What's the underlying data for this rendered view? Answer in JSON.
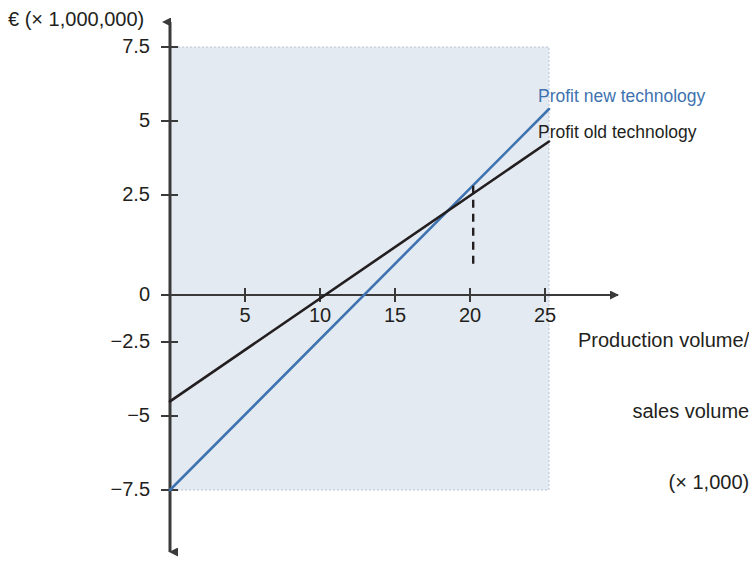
{
  "chart_data": {
    "type": "line",
    "title": "",
    "subtitle": "",
    "ylabel": "€ (× 1,000,000)",
    "xlabel_lines": [
      "Production volume/",
      "sales volume",
      "(× 1,000)"
    ],
    "xlabel": "Production volume/ sales volume (× 1,000)",
    "xlim": [
      0,
      25
    ],
    "ylim": [
      -7.5,
      7.5
    ],
    "xticks": [
      5,
      10,
      15,
      20,
      25
    ],
    "xtick_labels": [
      "5",
      "10",
      "15",
      "20",
      "25"
    ],
    "yticks": [
      7.5,
      5,
      2.5,
      0,
      -2.5,
      -5,
      -7.5
    ],
    "ytick_labels": [
      "7.5",
      "5",
      "2.5",
      "0",
      "−2.5",
      "−5",
      "−7.5"
    ],
    "grid": false,
    "legend_position": "right-inline",
    "series": [
      {
        "name": "Profit new technology",
        "color": "#3e73b0",
        "x": [
          0,
          25
        ],
        "values": [
          -7.5,
          5.4
        ],
        "zero_crossing": 14.5
      },
      {
        "name": "Profit old technology",
        "color": "#231f20",
        "x": [
          0,
          25
        ],
        "values": [
          -4.5,
          4.3
        ],
        "zero_crossing": 12.8
      }
    ],
    "annotations": [
      {
        "type": "intersection-dropline",
        "x": 20,
        "y": 2.8,
        "style": "dashed",
        "color": "#231f20"
      }
    ],
    "plot_background": "#e4eaf2",
    "axis_color": "#3a3a3a"
  },
  "colors": {
    "new_technology": "#3e73b0",
    "old_technology": "#231f20",
    "plot_background": "#e4eaf2",
    "axis": "#3a3a3a",
    "page_background": "#ffffff"
  },
  "legend": {
    "new_technology_label": "Profit new technology",
    "old_technology_label": "Profit old technology"
  },
  "axes": {
    "y_title": "€ (× 1,000,000)",
    "x_title_line1": "Production volume/",
    "x_title_line2": "sales volume",
    "x_title_line3": "(× 1,000)"
  },
  "ticks": {
    "y": [
      "7.5",
      "5",
      "2.5",
      "0",
      "−2.5",
      "−5",
      "−7.5"
    ],
    "x": [
      "5",
      "10",
      "15",
      "20",
      "25"
    ]
  }
}
